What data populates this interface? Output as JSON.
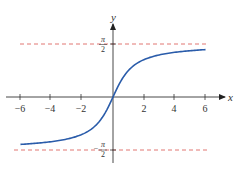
{
  "chart_data": {
    "type": "line",
    "title": "",
    "function": "y = arctan(x)",
    "xlabel": "x",
    "ylabel": "y",
    "xlim": [
      -6,
      6
    ],
    "ylim": [
      -1.5708,
      1.5708
    ],
    "grid": false,
    "legend": null,
    "x_ticks": [
      -6,
      -4,
      -2,
      2,
      4,
      6
    ],
    "x_tick_labels": [
      "−6",
      "−4",
      "−2",
      "2",
      "4",
      "6"
    ],
    "y_ticks": [
      1.5708,
      -1.5708
    ],
    "y_tick_labels": [
      "π/2",
      "−π/2"
    ],
    "series": [
      {
        "name": "arctan(x)",
        "color": "#2a5caa",
        "x": [
          -6,
          -5,
          -4,
          -3,
          -2,
          -1.5,
          -1,
          -0.5,
          0,
          0.5,
          1,
          1.5,
          2,
          3,
          4,
          5,
          6
        ],
        "y": [
          -1.406,
          -1.373,
          -1.326,
          -1.249,
          -1.107,
          -0.983,
          -0.785,
          -0.464,
          0,
          0.464,
          0.785,
          0.983,
          1.107,
          1.249,
          1.326,
          1.373,
          1.406
        ]
      }
    ],
    "asymptotes": [
      {
        "y": 1.5708,
        "label": "π/2",
        "style": "dashed",
        "color": "#d9534f"
      },
      {
        "y": -1.5708,
        "label": "−π/2",
        "style": "dashed",
        "color": "#d9534f"
      }
    ]
  },
  "labels": {
    "x_axis": "x",
    "y_axis": "y",
    "pi": "π",
    "two": "2",
    "minus": "−",
    "ticks": [
      "−6",
      "−4",
      "−2",
      "2",
      "4",
      "6"
    ]
  },
  "colors": {
    "curve": "#2a5caa",
    "asymptote": "#d9534f",
    "axis": "#333333"
  }
}
